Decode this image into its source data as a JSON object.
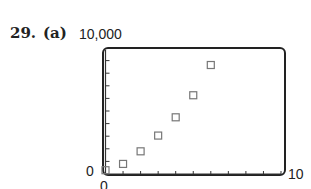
{
  "header": {
    "problem_number": "29.",
    "part_label": "(a)"
  },
  "axes": {
    "y_max_label": "10,000",
    "y_min_label": "0",
    "x_min_label": "0",
    "x_max_label": "10"
  },
  "chart_data": {
    "type": "scatter",
    "title": "",
    "xlabel": "",
    "ylabel": "",
    "xlim": [
      0,
      10
    ],
    "ylim": [
      0,
      10000
    ],
    "x_ticks_count": 10,
    "y_ticks_count": 10,
    "x_tick_spacing": 1,
    "y_tick_spacing": 1000,
    "grid": false,
    "marker": "open-square",
    "series": [
      {
        "name": "data",
        "x": [
          0,
          1,
          2,
          3,
          4,
          5,
          6
        ],
        "y": [
          300,
          800,
          1800,
          3050,
          4500,
          6250,
          8650
        ]
      }
    ],
    "frame": "rounded-rectangle viewing window",
    "colors": {
      "frame": "#222222",
      "marker": "#777777",
      "text": "#222222"
    }
  }
}
